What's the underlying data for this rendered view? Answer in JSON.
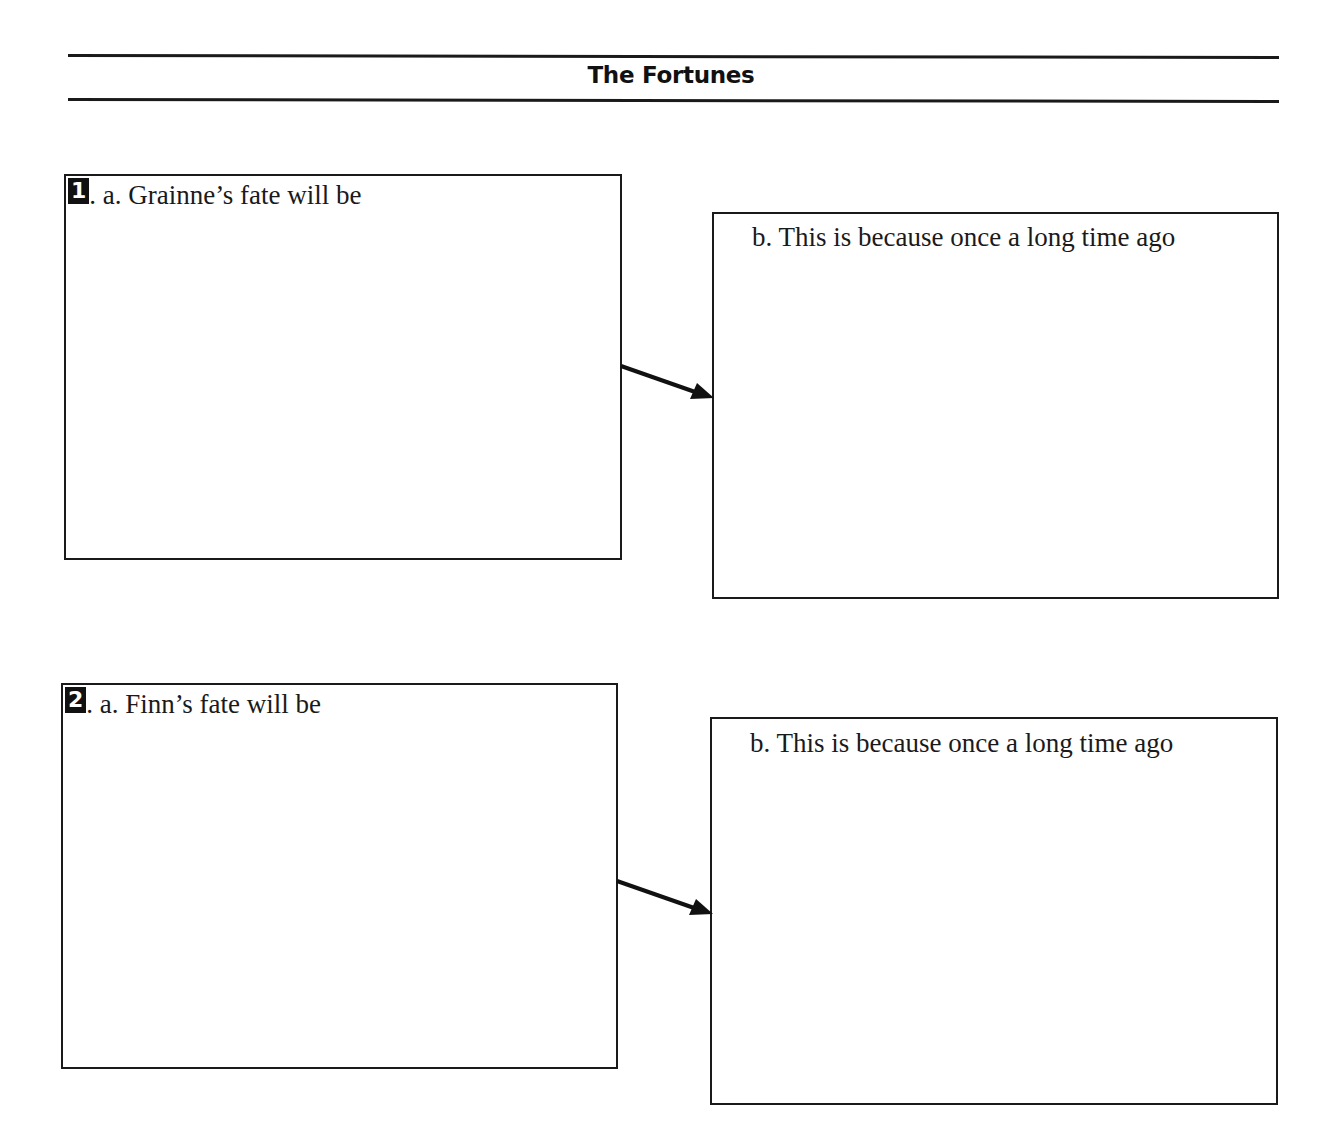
{
  "header": {
    "title": "The Fortunes"
  },
  "items": [
    {
      "number": "1",
      "a_label": ". a. Grainne’s fate will be",
      "b_label": "b. This is because once a long time ago"
    },
    {
      "number": "2",
      "a_label": ". a. Finn’s fate will be",
      "b_label": "b. This is because once a long time ago"
    }
  ]
}
